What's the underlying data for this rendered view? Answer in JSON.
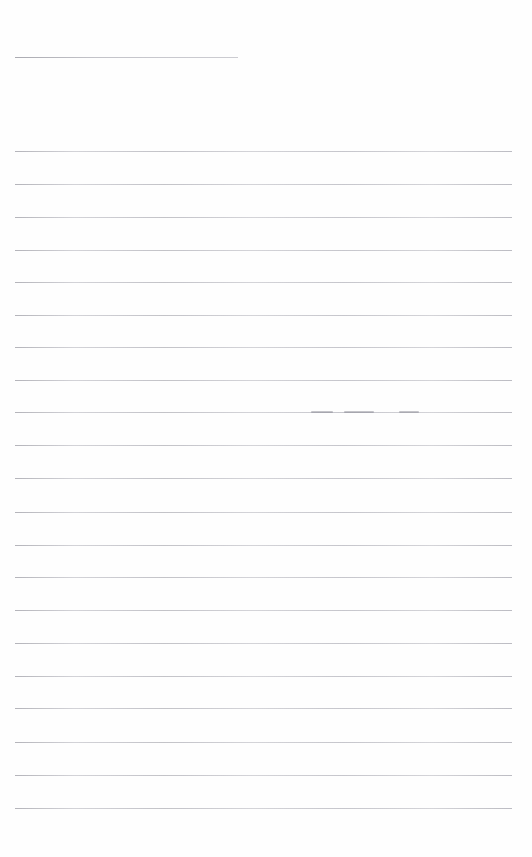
{
  "page": {
    "kind": "scanned-ruled-paper",
    "width": 532,
    "height": 857,
    "background_color": "#ffffff",
    "paper_color": "#fefefe",
    "rule_color": "#d2d2d6",
    "header_rule_color": "#c9c9ce",
    "smudge_color": "#787882",
    "content_text": "",
    "visible_text": []
  },
  "header_rule": {
    "name": "title-rule",
    "x": 15,
    "y": 57,
    "width": 223,
    "thickness": 1
  },
  "ruled_lines": {
    "count": 21,
    "left": 15,
    "right": 512,
    "width": 497,
    "first_y": 151,
    "spacing": 32.85,
    "thickness": 1,
    "y_positions": [
      151,
      184,
      217,
      250,
      282,
      315,
      347,
      380,
      412,
      445,
      478,
      512,
      545,
      577,
      610,
      643,
      676,
      708,
      742,
      775,
      808
    ]
  },
  "smudges": [
    {
      "name": "ink-smudge-1",
      "x": 311,
      "y": 411,
      "width": 22,
      "line_index": 8
    },
    {
      "name": "ink-smudge-2",
      "x": 344,
      "y": 411,
      "width": 30,
      "line_index": 8
    },
    {
      "name": "ink-smudge-3",
      "x": 399,
      "y": 411,
      "width": 20,
      "line_index": 8
    }
  ]
}
